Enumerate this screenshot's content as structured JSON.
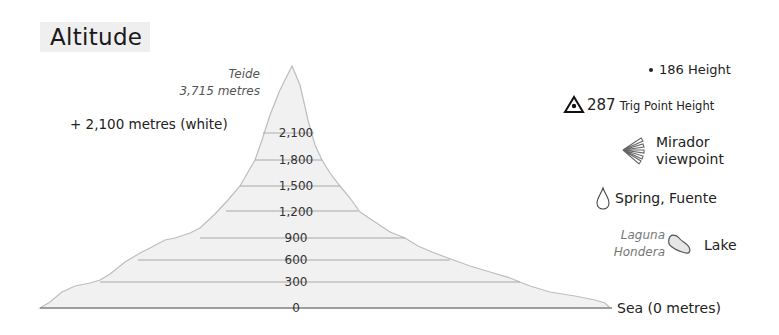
{
  "title": "Altitude",
  "peak": {
    "name": "Teide",
    "height": "3,715 metres"
  },
  "white_note": "+ 2,100 metres (white)",
  "contours": [
    {
      "label": "2,100",
      "value": 2100
    },
    {
      "label": "1,800",
      "value": 1800
    },
    {
      "label": "1,500",
      "value": 1500
    },
    {
      "label": "1,200",
      "value": 1200
    },
    {
      "label": "900",
      "value": 900
    },
    {
      "label": "600",
      "value": 600
    },
    {
      "label": "300",
      "value": 300
    },
    {
      "label": "0",
      "value": 0
    }
  ],
  "legend": {
    "height": {
      "value": "186",
      "label": "Height",
      "icon": "dot-icon"
    },
    "trig": {
      "value": "287",
      "label": "Trig Point Height",
      "icon": "trig-point-icon"
    },
    "mirador": {
      "line1": "Mirador",
      "line2": "viewpoint",
      "icon": "viewpoint-fan-icon"
    },
    "spring": {
      "label": "Spring, Fuente",
      "icon": "water-drop-icon"
    },
    "lake": {
      "name_line1": "Laguna",
      "name_line2": "Hondera",
      "label": "Lake",
      "icon": "lake-shape-icon"
    },
    "sea": {
      "label": "Sea (0 metres)"
    }
  },
  "colors": {
    "fill": "#f1f1f1",
    "outline": "#bdbdbd",
    "contour_line": "#a8a8a8",
    "baseline": "#8a8a8a"
  }
}
